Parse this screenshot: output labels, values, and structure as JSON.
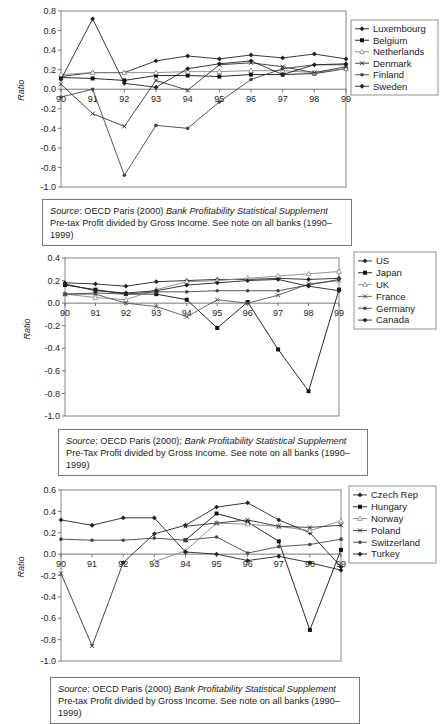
{
  "chart_data": [
    {
      "type": "line",
      "title": "",
      "xlabel": "",
      "ylabel": "Ratio",
      "x": [
        "90",
        "91",
        "92",
        "93",
        "94",
        "95",
        "96",
        "97",
        "98",
        "99"
      ],
      "ylim": [
        -1.0,
        0.8
      ],
      "yticks": [
        "0.8",
        "0.6",
        "0.4",
        "0.2",
        "0.0",
        "-0.2",
        "-0.4",
        "-0.6",
        "-0.8",
        "-1.0"
      ],
      "ytick_values": [
        0.8,
        0.6,
        0.4,
        0.2,
        0.0,
        -0.2,
        -0.4,
        -0.6,
        -0.8,
        -1.0
      ],
      "grid": false,
      "legend_position": "right",
      "series": [
        {
          "name": "Luxembourg",
          "marker": "diamond",
          "color": "#222222",
          "values": [
            0.13,
            0.17,
            0.17,
            0.29,
            0.34,
            0.31,
            0.35,
            0.32,
            0.36,
            0.31
          ]
        },
        {
          "name": "Belgium",
          "marker": "square",
          "color": "#111111",
          "values": [
            0.12,
            0.11,
            0.09,
            0.14,
            0.14,
            0.13,
            0.15,
            0.15,
            0.16,
            0.21
          ]
        },
        {
          "name": "Netherlands",
          "marker": "triangle",
          "color": "#888888",
          "values": [
            0.15,
            0.17,
            0.17,
            0.17,
            0.18,
            0.18,
            0.19,
            0.19,
            0.17,
            0.21
          ]
        },
        {
          "name": "Denmark",
          "marker": "cross",
          "color": "#333333",
          "values": [
            0.05,
            -0.25,
            -0.38,
            0.09,
            -0.01,
            0.25,
            0.27,
            0.23,
            0.17,
            0.23
          ]
        },
        {
          "name": "Finland",
          "marker": "dot",
          "color": "#444444",
          "values": [
            -0.08,
            0.0,
            -0.88,
            -0.37,
            -0.4,
            -0.13,
            0.1,
            0.21,
            0.25,
            0.25
          ]
        },
        {
          "name": "Sweden",
          "marker": "diamond",
          "color": "#222222",
          "values": [
            0.1,
            0.72,
            0.06,
            0.02,
            0.21,
            0.26,
            0.29,
            0.15,
            0.25,
            0.26
          ]
        }
      ],
      "source_label": "Source",
      "source_text": ": OECD Paris (2000) ",
      "source_title": "Bank Profitability Statistical Supplement",
      "note": "Pre-tax Profit divided by Gross Income. See note on all banks (1990–1999)"
    },
    {
      "type": "line",
      "title": "",
      "xlabel": "",
      "ylabel": "Ratio",
      "x": [
        "90",
        "91",
        "92",
        "93",
        "94",
        "95",
        "96",
        "97",
        "98",
        "99"
      ],
      "ylim": [
        -1.0,
        0.4
      ],
      "yticks": [
        "0.4",
        "0.2",
        "0.0",
        "-0.2",
        "-0.4",
        "-0.6",
        "-0.8",
        "-1.0"
      ],
      "ytick_values": [
        0.4,
        0.2,
        0.0,
        -0.2,
        -0.4,
        -0.6,
        -0.8,
        -1.0
      ],
      "grid": false,
      "legend_position": "right",
      "series": [
        {
          "name": "US",
          "marker": "diamond",
          "color": "#222222",
          "values": [
            0.18,
            0.17,
            0.15,
            0.19,
            0.2,
            0.21,
            0.21,
            0.22,
            0.21,
            0.22
          ]
        },
        {
          "name": "Japan",
          "marker": "square",
          "color": "#111111",
          "values": [
            0.16,
            0.12,
            0.08,
            0.08,
            0.03,
            -0.22,
            0.01,
            -0.41,
            -0.78,
            0.12
          ]
        },
        {
          "name": "UK",
          "marker": "triangle",
          "color": "#888888",
          "values": [
            0.08,
            0.05,
            0.03,
            0.12,
            0.19,
            0.2,
            0.22,
            0.24,
            0.26,
            0.28
          ]
        },
        {
          "name": "France",
          "marker": "cross",
          "color": "#555555",
          "values": [
            0.08,
            0.08,
            0.0,
            -0.03,
            -0.12,
            0.03,
            0.0,
            0.07,
            0.17,
            0.2
          ]
        },
        {
          "name": "Germany",
          "marker": "dot",
          "color": "#444444",
          "values": [
            0.08,
            0.09,
            0.08,
            0.1,
            0.1,
            0.11,
            0.11,
            0.11,
            0.16,
            0.21
          ]
        },
        {
          "name": "Canada",
          "marker": "diamond",
          "color": "#222222",
          "values": [
            0.17,
            0.11,
            0.09,
            0.11,
            0.16,
            0.18,
            0.2,
            0.21,
            0.15,
            0.11
          ]
        }
      ],
      "source_label": "Source",
      "source_text": ": OECD Paris (2000); ",
      "source_title": "Bank Profitability Statistical Supplement",
      "note": "Pre-Tax Profit divided by Gross Income. See note on all banks (1990–1999)"
    },
    {
      "type": "line",
      "title": "",
      "xlabel": "",
      "ylabel": "Ratio",
      "x": [
        "90",
        "91",
        "92",
        "93",
        "94",
        "95",
        "96",
        "97",
        "98",
        "99"
      ],
      "ylim": [
        -1.0,
        0.6
      ],
      "yticks": [
        "0.6",
        "0.4",
        "0.2",
        "0.0",
        "-0.2",
        "-0.4",
        "-0.6",
        "-0.8",
        "-1.0"
      ],
      "ytick_values": [
        0.6,
        0.4,
        0.2,
        0.0,
        -0.2,
        -0.4,
        -0.6,
        -0.8,
        -1.0
      ],
      "grid": false,
      "legend_position": "right",
      "series": [
        {
          "name": "Czech Rep",
          "marker": "diamond",
          "color": "#222222",
          "values": [
            null,
            null,
            -0.08,
            0.19,
            0.27,
            0.44,
            0.48,
            0.32,
            0.2,
            -0.12
          ]
        },
        {
          "name": "Hungary",
          "marker": "square",
          "color": "#111111",
          "values": [
            null,
            null,
            null,
            null,
            0.13,
            0.38,
            0.3,
            0.12,
            -0.71,
            0.04
          ]
        },
        {
          "name": "Norway",
          "marker": "triangle",
          "color": "#888888",
          "values": [
            null,
            null,
            null,
            -0.07,
            0.03,
            0.29,
            0.28,
            0.26,
            0.22,
            0.31
          ]
        },
        {
          "name": "Poland",
          "marker": "cross",
          "color": "#333333",
          "values": [
            -0.18,
            -0.86,
            -0.08,
            null,
            0.26,
            0.29,
            0.32,
            0.26,
            0.25,
            0.27
          ]
        },
        {
          "name": "Switzerland",
          "marker": "dot",
          "color": "#444444",
          "values": [
            0.14,
            0.13,
            0.13,
            0.15,
            0.13,
            0.16,
            0.01,
            0.07,
            0.09,
            0.14
          ]
        },
        {
          "name": "Turkey",
          "marker": "diamond",
          "color": "#222222",
          "values": [
            0.32,
            0.27,
            0.34,
            0.34,
            0.02,
            0.0,
            -0.06,
            -0.02,
            -0.08,
            -0.15
          ]
        }
      ],
      "source_label": "Source",
      "source_text": ": OECD Paris (2000) ",
      "source_title": "Bank Profitability Statistical Supplement",
      "note": "Pre-tax Profit divided by Gross Income. See note on all banks (1990–1999)"
    }
  ]
}
